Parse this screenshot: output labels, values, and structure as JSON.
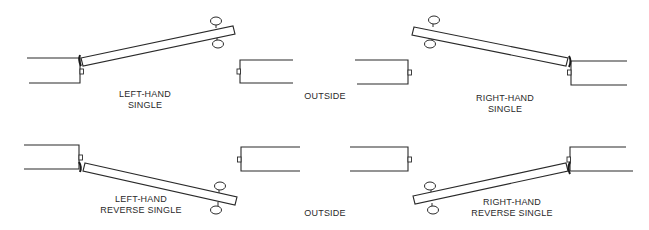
{
  "diagram": {
    "center_labels": {
      "top": "OUTSIDE",
      "bottom": "OUTSIDE"
    },
    "panels": [
      {
        "id": "left-hand-single",
        "label_line1": "LEFT-HAND",
        "label_line2": "SINGLE",
        "hinge_side": "left",
        "swing": "out"
      },
      {
        "id": "right-hand-single",
        "label_line1": "RIGHT-HAND",
        "label_line2": "SINGLE",
        "hinge_side": "right",
        "swing": "out"
      },
      {
        "id": "left-hand-reverse-single",
        "label_line1": "LEFT-HAND",
        "label_line2": "REVERSE SINGLE",
        "hinge_side": "left",
        "swing": "in"
      },
      {
        "id": "right-hand-reverse-single",
        "label_line1": "RIGHT-HAND",
        "label_line2": "REVERSE SINGLE",
        "hinge_side": "right",
        "swing": "in"
      }
    ],
    "colors": {
      "line": "#2a2a2a",
      "background": "#ffffff"
    }
  }
}
